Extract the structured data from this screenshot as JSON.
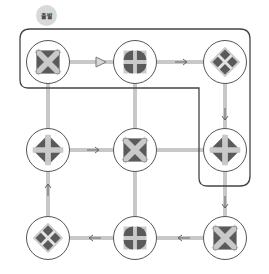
{
  "badge": {
    "label": "출발"
  },
  "colors": {
    "connector": "#c8c8c8",
    "outline": "#444444",
    "node_border": "#555555",
    "icon_dark": "#5a5a5a",
    "icon_light": "#c9c9c9",
    "badge_bg": "#d9d9d9"
  },
  "nodes": [
    {
      "id": "r1c1",
      "row": 1,
      "col": 1,
      "icon": "square-x-icon"
    },
    {
      "id": "r1c2",
      "row": 1,
      "col": 2,
      "icon": "square-plus-icon"
    },
    {
      "id": "r1c3",
      "row": 1,
      "col": 3,
      "icon": "diamond-x-icon"
    },
    {
      "id": "r2c1",
      "row": 2,
      "col": 1,
      "icon": "diamond-plus-icon"
    },
    {
      "id": "r2c2",
      "row": 2,
      "col": 2,
      "icon": "square-x-icon"
    },
    {
      "id": "r2c3",
      "row": 2,
      "col": 3,
      "icon": "diamond-plus-icon"
    },
    {
      "id": "r3c1",
      "row": 3,
      "col": 1,
      "icon": "diamond-x-icon"
    },
    {
      "id": "r3c2",
      "row": 3,
      "col": 2,
      "icon": "square-plus-icon"
    },
    {
      "id": "r3c3",
      "row": 3,
      "col": 3,
      "icon": "square-x-icon"
    }
  ],
  "arrows": [
    {
      "from": "r1c1",
      "to": "r1c2",
      "direction": "right",
      "style": "large"
    },
    {
      "from": "r1c2",
      "to": "r1c3",
      "direction": "right",
      "style": "small"
    },
    {
      "from": "r1c3",
      "to": "r2c3",
      "direction": "down",
      "style": "small"
    },
    {
      "from": "r2c1",
      "to": "r2c2",
      "direction": "right",
      "style": "small"
    },
    {
      "from": "r2c3",
      "to": "r3c3",
      "direction": "down",
      "style": "small"
    },
    {
      "from": "r3c3",
      "to": "r3c2",
      "direction": "left",
      "style": "small"
    },
    {
      "from": "r3c2",
      "to": "r3c1",
      "direction": "left",
      "style": "small"
    },
    {
      "from": "r3c1",
      "to": "r2c1",
      "direction": "up",
      "style": "small"
    }
  ],
  "plain_connectors": [
    {
      "from": "r1c1",
      "to": "r2c1"
    },
    {
      "from": "r1c2",
      "to": "r2c2"
    },
    {
      "from": "r2c2",
      "to": "r2c3"
    },
    {
      "from": "r2c2",
      "to": "r3c2"
    }
  ]
}
